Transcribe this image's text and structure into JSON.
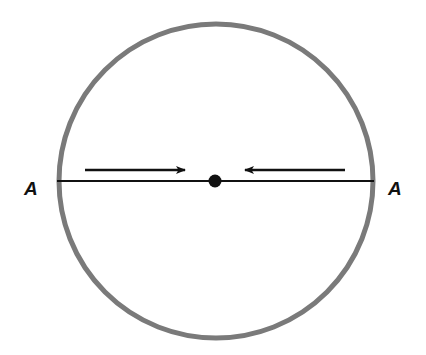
{
  "diagram": {
    "circle": {
      "cx": 216,
      "cy": 181,
      "r": 157,
      "stroke": "#7a7a7a",
      "stroke_width": 5
    },
    "diameter": {
      "x1": 57,
      "x2": 374,
      "y": 181,
      "stroke": "#111111"
    },
    "center_dot": {
      "cx": 215,
      "cy": 181,
      "r": 6.5,
      "fill": "#111111"
    },
    "arrows": [
      {
        "name": "arrow-right",
        "x1": 85,
        "x2": 185,
        "y": 170,
        "direction": "right"
      },
      {
        "name": "arrow-left",
        "x1": 345,
        "x2": 245,
        "y": 170,
        "direction": "left"
      }
    ],
    "labels": {
      "left": {
        "text": "A",
        "x": 24,
        "y": 195
      },
      "right": {
        "text": "A",
        "x": 388,
        "y": 195
      }
    }
  }
}
